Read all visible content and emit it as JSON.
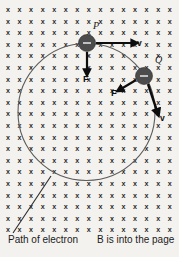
{
  "figure": {
    "title_caption": "Path of electron",
    "field_caption_bold": "B",
    "field_caption_rest": " is into the page",
    "background_color": "#f4f2ef",
    "field_symbol": "x",
    "field_symbol_name": "magnetic-field-into-page-x",
    "orbit": {
      "center_x": 86.5,
      "center_y": 112,
      "radius": 68.5,
      "stroke_color": "#5b5b5b"
    },
    "grid": {
      "start_x": 8,
      "start_y": 12,
      "step_x": 11.55,
      "step_y": 11.6,
      "cols": 15,
      "rows": 20
    },
    "particles": [
      {
        "id": "P",
        "label": "P",
        "charge_sign": "-",
        "cx": 87,
        "cy": 43,
        "r": 8.5,
        "label_x": 93,
        "label_y": 29,
        "velocity": {
          "label": "v",
          "x1": 96,
          "y1": 43,
          "x2": 133,
          "y2": 43,
          "label_x": 137,
          "label_y": 46,
          "width": 2.2
        },
        "force": {
          "label": "F",
          "x1": 87,
          "y1": 52,
          "x2": 87,
          "y2": 71,
          "label_x": 83,
          "label_y": 82,
          "width": 2.2
        }
      },
      {
        "id": "Q",
        "label": "Q",
        "charge_sign": "-",
        "cx": 144,
        "cy": 76,
        "r": 8.5,
        "label_x": 155,
        "label_y": 63,
        "velocity": {
          "label": "v",
          "x1": 148,
          "y1": 84,
          "x2": 157,
          "y2": 111,
          "label_x": 160,
          "label_y": 121,
          "width": 2.4
        },
        "force": {
          "label": "F",
          "x1": 136,
          "y1": 80,
          "x2": 121,
          "y2": 89,
          "label_x": 111,
          "label_y": 96,
          "width": 2.2
        }
      }
    ],
    "leader": {
      "name": "path-of-electron-leader",
      "x1": 51,
      "y1": 176,
      "x2": 13,
      "y2": 233
    },
    "captions": [
      {
        "name": "path-of-electron-caption",
        "x": 8,
        "y": 243
      },
      {
        "name": "field-direction-caption",
        "x": 97,
        "y": 243
      }
    ]
  }
}
